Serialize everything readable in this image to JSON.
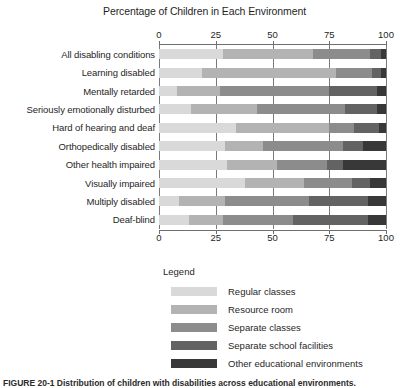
{
  "chart_data": {
    "type": "bar",
    "orientation": "horizontal",
    "stacked": true,
    "title": "Percentage of Children in Each Environment",
    "xlabel": "",
    "ylabel": "",
    "xlim": [
      0,
      100
    ],
    "xticks": [
      0,
      25,
      50,
      75,
      100
    ],
    "xtick_labels": [
      "0",
      "25",
      "50",
      "75",
      "100"
    ],
    "grid": true,
    "grid_axis": "x",
    "axis_top": true,
    "axis_bottom": true,
    "legend_position": "below-plot",
    "legend_title": "Legend",
    "categories": [
      "All disabling conditions",
      "Learning disabled",
      "Mentally retarded",
      "Seriously emotionally disturbed",
      "Hard of hearing and deaf",
      "Orthopedically disabled",
      "Other health impaired",
      "Visually impaired",
      "Multiply disabled",
      "Deaf-blind"
    ],
    "series": [
      {
        "name": "Regular classes",
        "color": "#d9d9d9",
        "values": [
          28,
          19,
          8,
          14,
          34,
          29,
          30,
          38,
          9,
          13
        ]
      },
      {
        "name": "Resource room",
        "color": "#b3b3b3",
        "values": [
          40,
          59,
          19,
          29,
          41,
          17,
          22,
          26,
          20,
          15
        ]
      },
      {
        "name": "Separate classes",
        "color": "#8c8c8c",
        "values": [
          25,
          16,
          48,
          39,
          11,
          35,
          22,
          21,
          37,
          31
        ]
      },
      {
        "name": "Separate school facilities",
        "color": "#636363",
        "values": [
          5,
          4,
          21,
          14,
          11,
          9,
          7,
          8,
          26,
          33
        ]
      },
      {
        "name": "Other educational environments",
        "color": "#383838",
        "values": [
          2,
          2,
          4,
          4,
          3,
          10,
          19,
          7,
          8,
          8
        ]
      }
    ]
  },
  "legend": {
    "title": "Legend",
    "items": [
      {
        "label": "Regular classes",
        "color": "#d9d9d9"
      },
      {
        "label": "Resource room",
        "color": "#b3b3b3"
      },
      {
        "label": "Separate classes",
        "color": "#8c8c8c"
      },
      {
        "label": "Separate school facilities",
        "color": "#636363"
      },
      {
        "label": "Other educational environments",
        "color": "#383838"
      }
    ]
  },
  "caption": {
    "text": "FIGURE 20-1  Distribution of children with disabilities across educational environments."
  }
}
